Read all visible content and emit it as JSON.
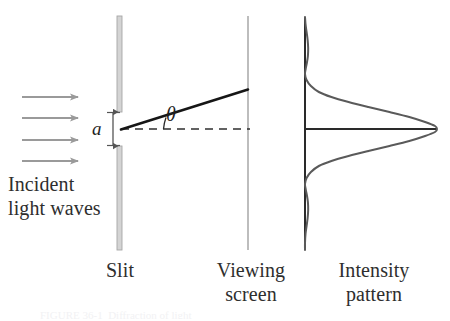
{
  "figure": {
    "kind": "single-slit-diffraction-diagram",
    "background_color": "#ffffff",
    "width": 450,
    "height": 321
  },
  "labels": {
    "incident": "Incident\nlight waves",
    "slit": "Slit",
    "viewing_screen": "Viewing\nscreen",
    "intensity_pattern": "Intensity\npattern",
    "slit_width_symbol": "a",
    "angle_symbol": "θ",
    "caption_fragment": "FIGURE 36-1  Diffraction of light"
  },
  "colors": {
    "barrier": "#c9c9c9",
    "barrier_edge": "#a6a6a6",
    "screen_line": "#bdbdbd",
    "arrow": "#9a9a9a",
    "ray": "#161616",
    "axis": "#2a2a2a",
    "dashed_axis": "#2f2f2f",
    "curve": "#5a5a5a",
    "dimension": "#555555",
    "text": "#2e2e2e"
  },
  "geometry": {
    "barrier_x": 119,
    "barrier_top_span": [
      16,
      112
    ],
    "barrier_bottom_span": [
      146,
      250
    ],
    "slit_gap": [
      112,
      146
    ],
    "slit_center": [
      121,
      129
    ],
    "screen_x": 248,
    "screen_span": [
      16,
      250
    ],
    "ray_end": [
      248,
      90
    ],
    "dashed_axis_y": 129,
    "dashed_axis_span": [
      121,
      250
    ],
    "intensity_axis_x": 305,
    "intensity_axis_span": [
      17,
      250
    ],
    "intensity_baseline_y": 129,
    "intensity_baseline_span": [
      305,
      437
    ],
    "peak_x": 437,
    "arrow_rows_y": [
      97,
      118,
      140,
      161
    ],
    "arrow_x_span": [
      22,
      80
    ]
  },
  "chart_data": {
    "type": "line",
    "title": "Intensity pattern",
    "xlabel": "Relative intensity",
    "ylabel": "Position on viewing screen",
    "orientation": "horizontal-intensity-vs-vertical-position",
    "axis_ranges": {
      "intensity": [
        0,
        1
      ],
      "position_px": [
        17,
        250
      ]
    },
    "grid": false,
    "legend": false,
    "series": [
      {
        "name": "I/I0 vs screen position",
        "points": [
          [
            0.0,
            17
          ],
          [
            0.004,
            24
          ],
          [
            0.012,
            32
          ],
          [
            0.02,
            40
          ],
          [
            0.024,
            48
          ],
          [
            0.022,
            56
          ],
          [
            0.014,
            63
          ],
          [
            0.005,
            69
          ],
          [
            0.0,
            74
          ],
          [
            0.012,
            80
          ],
          [
            0.045,
            86
          ],
          [
            0.105,
            92
          ],
          [
            0.2,
            97
          ],
          [
            0.33,
            102
          ],
          [
            0.48,
            107
          ],
          [
            0.64,
            112
          ],
          [
            0.79,
            117
          ],
          [
            0.91,
            122
          ],
          [
            0.985,
            126
          ],
          [
            1.0,
            129
          ],
          [
            0.985,
            132
          ],
          [
            0.91,
            136
          ],
          [
            0.79,
            141
          ],
          [
            0.64,
            146
          ],
          [
            0.48,
            151
          ],
          [
            0.33,
            156
          ],
          [
            0.2,
            161
          ],
          [
            0.105,
            166
          ],
          [
            0.045,
            172
          ],
          [
            0.012,
            178
          ],
          [
            0.0,
            184
          ],
          [
            0.005,
            189
          ],
          [
            0.014,
            195
          ],
          [
            0.022,
            202
          ],
          [
            0.024,
            210
          ],
          [
            0.02,
            218
          ],
          [
            0.012,
            226
          ],
          [
            0.004,
            234
          ],
          [
            0.0,
            243
          ],
          [
            0.0,
            250
          ]
        ]
      }
    ],
    "annotations": [
      {
        "text": "central maximum",
        "at_position_px": 129
      },
      {
        "text": "first minimum (upper)",
        "at_position_px": 74
      },
      {
        "text": "first minimum (lower)",
        "at_position_px": 184
      },
      {
        "text": "first secondary maximum (upper)",
        "at_position_px": 48
      },
      {
        "text": "first secondary maximum (lower)",
        "at_position_px": 210
      }
    ]
  }
}
